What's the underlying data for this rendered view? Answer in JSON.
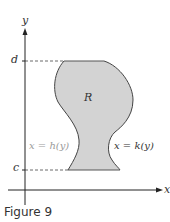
{
  "figure": {
    "caption": "Figure 9",
    "axes": {
      "x_label": "x",
      "y_label": "y"
    },
    "ticks": {
      "d": "d",
      "c": "c"
    },
    "region_label": "R",
    "left_curve_label": "x = h(y)",
    "right_curve_label": "x = k(y)"
  },
  "colors": {
    "region_fill": "#d3d3d3",
    "curve_stroke": "#444444",
    "axis": "#222222",
    "left_label": "#9a9a9a",
    "text": "#333333"
  }
}
